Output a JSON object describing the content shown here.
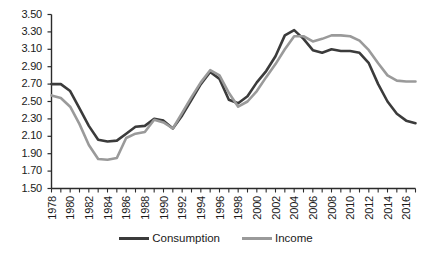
{
  "chart_data": {
    "type": "line",
    "title": "",
    "subtitle": "",
    "xlabel": "",
    "ylabel": "",
    "xlim": [
      1978,
      2017
    ],
    "ylim": [
      1.5,
      3.5
    ],
    "grid": false,
    "legend_position": "bottom",
    "x": [
      1978,
      1979,
      1980,
      1981,
      1982,
      1983,
      1984,
      1985,
      1986,
      1987,
      1988,
      1989,
      1990,
      1991,
      1992,
      1993,
      1994,
      1995,
      1996,
      1997,
      1998,
      1999,
      2000,
      2001,
      2002,
      2003,
      2004,
      2005,
      2006,
      2007,
      2008,
      2009,
      2010,
      2011,
      2012,
      2013,
      2014,
      2015,
      2016,
      2017
    ],
    "y_ticks": [
      "1.50",
      "1.70",
      "1.90",
      "2.10",
      "2.30",
      "2.50",
      "2.70",
      "2.90",
      "3.10",
      "3.30",
      "3.50"
    ],
    "x_ticks": [
      "1978",
      "1980",
      "1982",
      "1984",
      "1986",
      "1988",
      "1990",
      "1992",
      "1994",
      "1996",
      "1998",
      "2000",
      "2002",
      "2004",
      "2006",
      "2008",
      "2010",
      "2012",
      "2014",
      "2016"
    ],
    "series": [
      {
        "name": "Consumption",
        "color": "#3b3b3b",
        "values": [
          2.7,
          2.7,
          2.62,
          2.42,
          2.22,
          2.06,
          2.04,
          2.05,
          2.13,
          2.21,
          2.22,
          2.3,
          2.28,
          2.19,
          2.34,
          2.52,
          2.7,
          2.84,
          2.76,
          2.52,
          2.48,
          2.56,
          2.72,
          2.85,
          3.02,
          3.26,
          3.32,
          3.22,
          3.09,
          3.06,
          3.1,
          3.08,
          3.08,
          3.06,
          2.94,
          2.7,
          2.5,
          2.36,
          2.28,
          2.25
        ]
      },
      {
        "name": "Income",
        "color": "#9a9a9a",
        "values": [
          2.57,
          2.54,
          2.44,
          2.24,
          2.0,
          1.84,
          1.83,
          1.85,
          2.08,
          2.13,
          2.15,
          2.29,
          2.26,
          2.19,
          2.37,
          2.55,
          2.72,
          2.86,
          2.8,
          2.6,
          2.44,
          2.5,
          2.62,
          2.78,
          2.93,
          3.1,
          3.25,
          3.25,
          3.19,
          3.22,
          3.26,
          3.26,
          3.25,
          3.2,
          3.09,
          2.94,
          2.8,
          2.74,
          2.73,
          2.73
        ]
      }
    ]
  },
  "legend": {
    "items": [
      {
        "label": "Consumption",
        "color": "#3b3b3b"
      },
      {
        "label": "Income",
        "color": "#9a9a9a"
      }
    ]
  },
  "axis": {
    "color": "#2b2b2b"
  }
}
